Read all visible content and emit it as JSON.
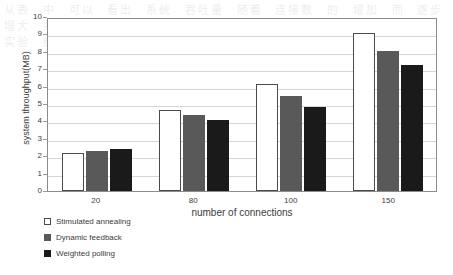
{
  "chart_data": {
    "type": "bar",
    "title": "",
    "xlabel": "number of connections",
    "ylabel": "system throughput(MB)",
    "categories": [
      "20",
      "80",
      "100",
      "150"
    ],
    "ylim": [
      0,
      10
    ],
    "yticks": [
      "0",
      "1",
      "2",
      "3",
      "4",
      "5",
      "6",
      "7",
      "8",
      "9",
      "10"
    ],
    "grid": true,
    "legend_position": "below-left",
    "series": [
      {
        "name": "Stimulated annealing",
        "color": "#ffffff",
        "values": [
          2.2,
          4.65,
          6.15,
          9.1
        ]
      },
      {
        "name": "Dynamic feedback",
        "color": "#595959",
        "values": [
          2.3,
          4.35,
          5.45,
          8.05
        ]
      },
      {
        "name": "Weighted polling",
        "color": "#1a1a1a",
        "values": [
          2.4,
          4.1,
          4.85,
          7.25
        ]
      }
    ]
  },
  "background_bleed": "从表 中 可以 看出 系统 吞吐量 随着 连接数 的 增加 而 逐步 增大 并且 模拟退火 算法 的 性能 优于 其他 两种 调度 算法 实验 结果 表明 该 方法 有效"
}
